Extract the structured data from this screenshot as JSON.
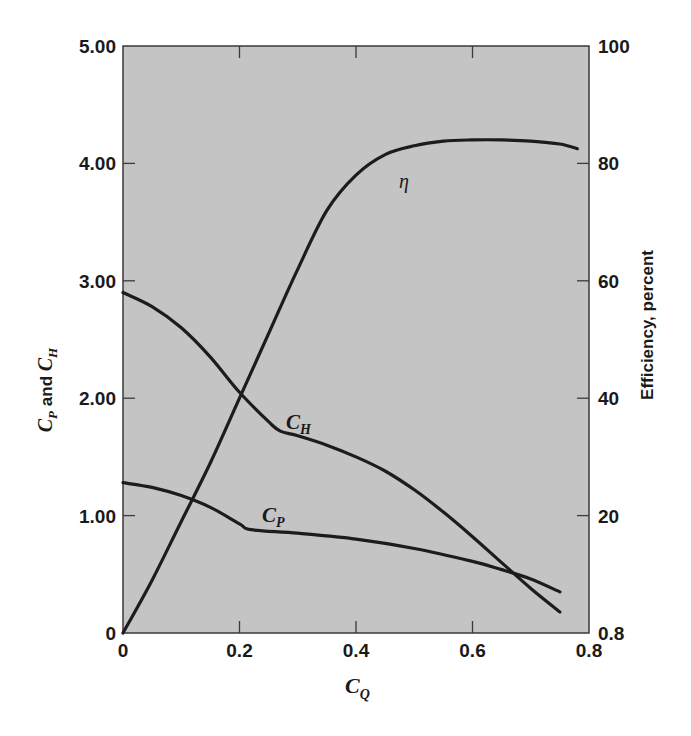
{
  "chart_data": {
    "type": "line",
    "title": "",
    "xlabel": "C_Q",
    "ylabel_left": "C_P and C_H",
    "ylabel_right": "Efficiency, percent",
    "xlim": [
      0,
      0.8
    ],
    "ylim_left": [
      0,
      5.0
    ],
    "ylim_right": [
      0,
      100
    ],
    "x_ticks": [
      "0",
      "0.2",
      "0.4",
      "0.6",
      "0.8"
    ],
    "y_left_ticks": [
      "0",
      "1.00",
      "2.00",
      "3.00",
      "4.00",
      "5.00"
    ],
    "y_right_ticks": [
      "0.8",
      "20",
      "40",
      "60",
      "80",
      "100"
    ],
    "grid": false,
    "background": "#c4c4c4",
    "series": [
      {
        "name": "C_H",
        "label_main": "C",
        "label_sub": "H",
        "axis": "left",
        "x": [
          0,
          0.05,
          0.1,
          0.15,
          0.2,
          0.25,
          0.27,
          0.3,
          0.35,
          0.4,
          0.45,
          0.5,
          0.55,
          0.6,
          0.65,
          0.7,
          0.75
        ],
        "y": [
          2.9,
          2.78,
          2.6,
          2.35,
          2.05,
          1.8,
          1.72,
          1.68,
          1.6,
          1.5,
          1.38,
          1.22,
          1.03,
          0.82,
          0.6,
          0.38,
          0.18
        ]
      },
      {
        "name": "C_P",
        "label_main": "C",
        "label_sub": "P",
        "axis": "left",
        "x": [
          0,
          0.05,
          0.1,
          0.15,
          0.2,
          0.22,
          0.3,
          0.4,
          0.5,
          0.6,
          0.65,
          0.7,
          0.75
        ],
        "y": [
          1.28,
          1.24,
          1.17,
          1.07,
          0.93,
          0.88,
          0.85,
          0.8,
          0.72,
          0.61,
          0.54,
          0.46,
          0.35
        ]
      },
      {
        "name": "eta",
        "label": "η",
        "axis": "right",
        "x": [
          0,
          0.05,
          0.1,
          0.15,
          0.2,
          0.25,
          0.3,
          0.35,
          0.4,
          0.45,
          0.5,
          0.55,
          0.6,
          0.65,
          0.7,
          0.75,
          0.78
        ],
        "y": [
          0,
          9,
          19,
          29,
          40,
          51,
          62,
          72,
          78,
          81.5,
          83,
          83.8,
          84,
          84,
          83.8,
          83.3,
          82.5
        ]
      }
    ]
  }
}
